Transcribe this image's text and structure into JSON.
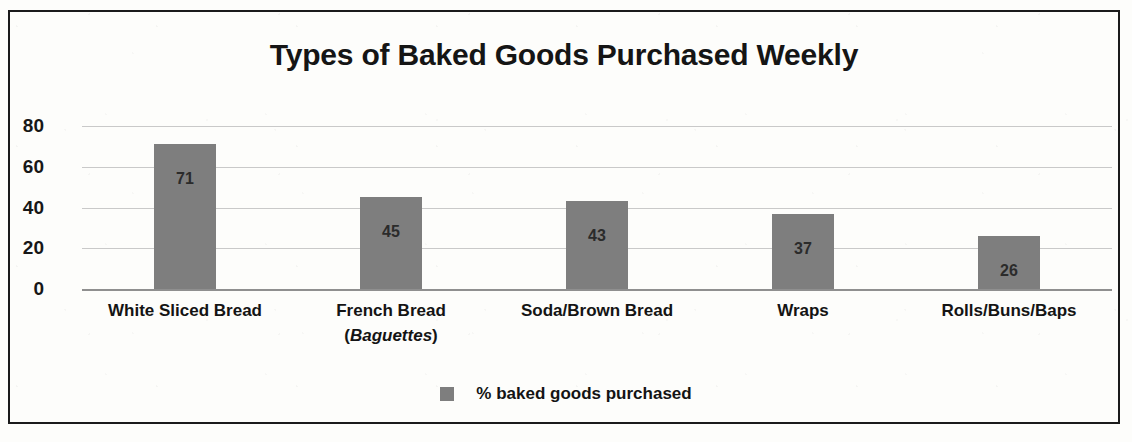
{
  "frame": {
    "border_color": "#1b1b1b"
  },
  "chart_data": {
    "type": "bar",
    "title": "Types of Baked Goods Purchased Weekly",
    "xlabel": "",
    "ylabel": "",
    "ylim": [
      0,
      80
    ],
    "yticks": [
      0,
      20,
      40,
      60,
      80
    ],
    "ytick_labels": [
      "0",
      "20",
      "40",
      "60",
      "80"
    ],
    "grid": true,
    "legend_position": "bottom",
    "bar_color": "#7e7e7e",
    "categories": [
      "White Sliced Bread",
      "French Bread (Baguettes)",
      "Soda/Brown Bread",
      "Wraps",
      "Rolls/Buns/Baps"
    ],
    "category_lines": [
      {
        "line1": "White Sliced Bread",
        "line2": "",
        "line2_italic": ""
      },
      {
        "line1": "French Bread",
        "line2_prefix": "(",
        "line2_italic": "Baguettes",
        "line2_suffix": ")"
      },
      {
        "line1": "Soda/Brown Bread",
        "line2": "",
        "line2_italic": ""
      },
      {
        "line1": "Wraps",
        "line2": "",
        "line2_italic": ""
      },
      {
        "line1": "Rolls/Buns/Baps",
        "line2": "",
        "line2_italic": ""
      }
    ],
    "values": [
      71,
      45,
      43,
      37,
      26
    ],
    "value_labels": [
      "71",
      "45",
      "43",
      "37",
      "26"
    ],
    "series": [
      {
        "name": "% baked goods purchased",
        "values": [
          71,
          45,
          43,
          37,
          26
        ]
      }
    ],
    "legend": [
      {
        "label": "% baked goods purchased",
        "color": "#7e7e7e"
      }
    ]
  }
}
